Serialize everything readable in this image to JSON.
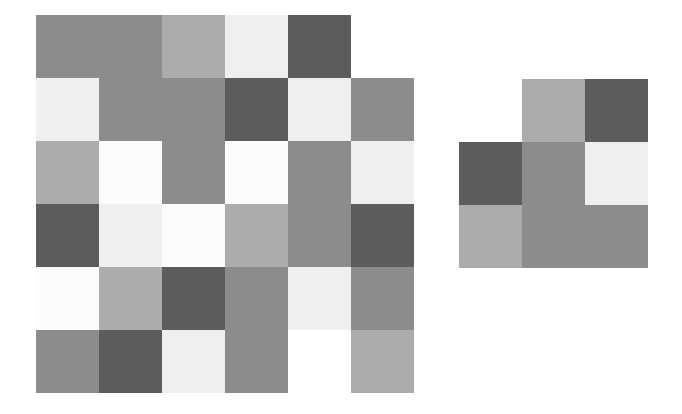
{
  "palette": {
    "dark": "#5c5c5c",
    "mid": "#8c8c8c",
    "light": "#acacac",
    "pale": "#efefef",
    "white": "#fcfcfc",
    "empty": "#ffffff"
  },
  "grids": [
    {
      "name": "left-grid",
      "x": 36,
      "y": 15,
      "cell": 63,
      "rows": [
        [
          "mid",
          "mid",
          "light",
          "pale",
          "dark",
          "empty"
        ],
        [
          "pale",
          "mid",
          "mid",
          "dark",
          "pale",
          "mid"
        ],
        [
          "light",
          "white",
          "mid",
          "white",
          "mid",
          "pale"
        ],
        [
          "dark",
          "pale",
          "white",
          "light",
          "mid",
          "dark"
        ],
        [
          "white",
          "light",
          "dark",
          "mid",
          "pale",
          "mid"
        ],
        [
          "mid",
          "dark",
          "pale",
          "mid",
          "empty",
          "light"
        ]
      ]
    },
    {
      "name": "right-grid",
      "x": 459,
      "y": 79,
      "cell": 63,
      "rows": [
        [
          "empty",
          "light",
          "dark"
        ],
        [
          "dark",
          "mid",
          "pale"
        ],
        [
          "light",
          "mid",
          "mid"
        ]
      ]
    }
  ]
}
